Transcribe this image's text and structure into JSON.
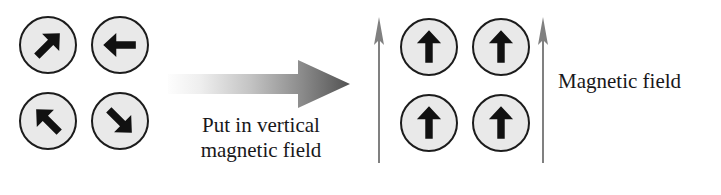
{
  "figure": {
    "background_color": "#ffffff",
    "width": 721,
    "height": 195
  },
  "colors": {
    "magnet_fill": "#e9e9e9",
    "magnet_outline": "#1c1c1c",
    "moment_arrow": "#111111",
    "field_arrow": "#808080",
    "transition_arrow_light": "#fcfcfc",
    "transition_arrow_dark": "#555555",
    "text": "#18181a"
  },
  "unaligned_group": {
    "name": "Randomly oriented magnetic moments",
    "magnets": [
      {
        "id": "magnet-top-left",
        "arrow_direction": "up-right",
        "angle_degrees": 45,
        "x": 19,
        "y": 16
      },
      {
        "id": "magnet-top-right",
        "arrow_direction": "left",
        "angle_degrees": 180,
        "x": 91,
        "y": 16
      },
      {
        "id": "magnet-bottom-left",
        "arrow_direction": "up-left",
        "angle_degrees": 135,
        "x": 19,
        "y": 92
      },
      {
        "id": "magnet-bottom-right",
        "arrow_direction": "down-right",
        "angle_degrees": -45,
        "x": 91,
        "y": 92
      }
    ]
  },
  "transition": {
    "arrow_name": "rightward-gradient-arrow",
    "caption_lines": [
      "Put in vertical",
      "magnetic field"
    ]
  },
  "aligned_group": {
    "name": "Aligned magnetic moments",
    "magnets": [
      {
        "id": "aligned-magnet-top-left",
        "arrow_direction": "up",
        "angle_degrees": 90,
        "x": 400,
        "y": 18
      },
      {
        "id": "aligned-magnet-top-right",
        "arrow_direction": "up",
        "angle_degrees": 90,
        "x": 472,
        "y": 18
      },
      {
        "id": "aligned-magnet-bottom-left",
        "arrow_direction": "up",
        "angle_degrees": 90,
        "x": 400,
        "y": 94
      },
      {
        "id": "aligned-magnet-bottom-right",
        "arrow_direction": "up",
        "angle_degrees": 90,
        "x": 472,
        "y": 94
      }
    ],
    "field_arrows": [
      {
        "id": "field-arrow-left",
        "direction": "up",
        "x": 371,
        "y": 15
      },
      {
        "id": "field-arrow-right",
        "direction": "up",
        "x": 535,
        "y": 15
      }
    ],
    "field_label": "Magnetic field"
  }
}
